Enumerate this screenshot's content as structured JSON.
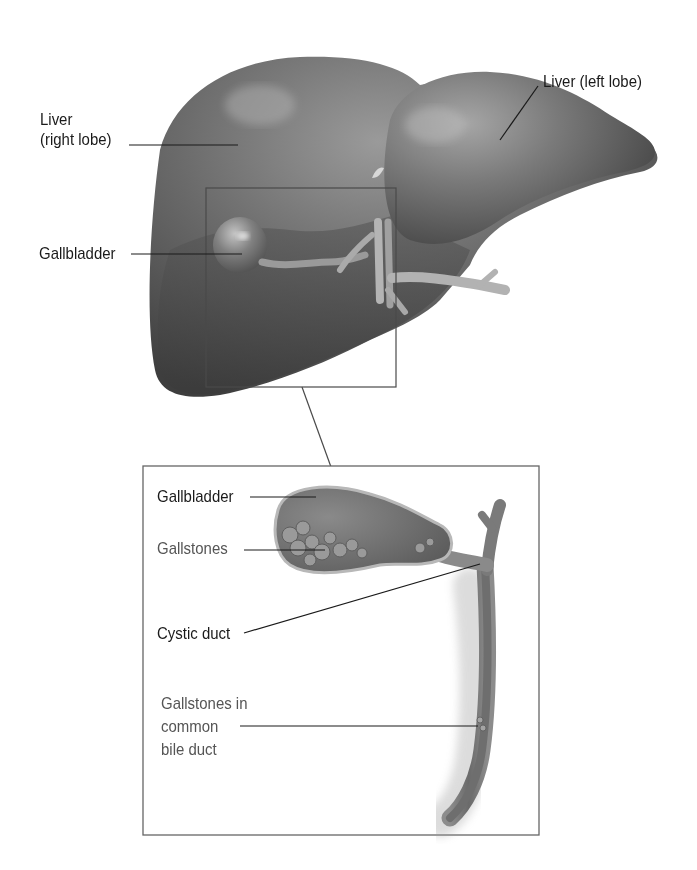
{
  "diagram": {
    "style": "grayscale medical illustration",
    "colors": {
      "background": "#ffffff",
      "organ_dark": "#4a4a4a",
      "organ_mid": "#6e6e6e",
      "organ_highlight": "#a8a8a8",
      "leader_line": "#1a1a1a",
      "frame_line": "#555555"
    }
  },
  "main_view": {
    "labels": [
      {
        "id": "liver-right-lobe",
        "lines": [
          "Liver",
          "(right lobe)"
        ]
      },
      {
        "id": "gallbladder",
        "lines": [
          "Gallbladder"
        ]
      },
      {
        "id": "liver-left-lobe",
        "lines": [
          "Liver (left lobe)"
        ]
      }
    ]
  },
  "inset_view": {
    "labels": [
      {
        "id": "inset-gallbladder",
        "lines": [
          "Gallbladder"
        ]
      },
      {
        "id": "gallstones",
        "lines": [
          "Gallstones"
        ]
      },
      {
        "id": "cystic-duct",
        "lines": [
          "Cystic duct"
        ]
      },
      {
        "id": "gallstones-in-cbd",
        "lines": [
          "Gallstones in",
          "common",
          "bile duct"
        ]
      }
    ]
  }
}
